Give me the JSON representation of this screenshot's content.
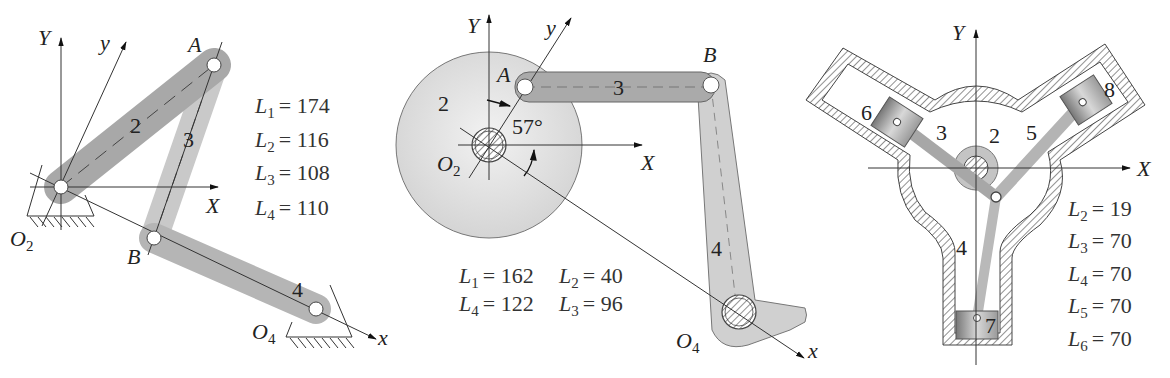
{
  "figures": [
    {
      "id": "four-bar-linkage",
      "axes": {
        "X": "X",
        "Y": "Y",
        "x": "x",
        "y": "y"
      },
      "points": {
        "O2": "O",
        "O2_sub": "2",
        "O4": "O",
        "O4_sub": "4",
        "A": "A",
        "B": "B"
      },
      "links": [
        "2",
        "3",
        "4"
      ],
      "lengths": [
        {
          "sym": "L",
          "sub": "1",
          "value": "= 174"
        },
        {
          "sym": "L",
          "sub": "2",
          "value": "= 116"
        },
        {
          "sym": "L",
          "sub": "3",
          "value": "= 108"
        },
        {
          "sym": "L",
          "sub": "4",
          "value": "= 110"
        }
      ]
    },
    {
      "id": "disc-crank-linkage",
      "axes": {
        "X": "X",
        "Y": "Y",
        "x": "x",
        "y": "y"
      },
      "points": {
        "O2": "O",
        "O2_sub": "2",
        "O4": "O",
        "O4_sub": "4",
        "A": "A",
        "B": "B"
      },
      "links": [
        "2",
        "3",
        "4"
      ],
      "angle": "57°",
      "lengths": [
        {
          "sym": "L",
          "sub": "1",
          "value": "= 162"
        },
        {
          "sym": "L",
          "sub": "2",
          "value": "= 40"
        },
        {
          "sym": "L",
          "sub": "4",
          "value": "= 122"
        },
        {
          "sym": "L",
          "sub": "3",
          "value": "= 96"
        }
      ]
    },
    {
      "id": "radial-engine",
      "axes": {
        "X": "X",
        "Y": "Y"
      },
      "links": [
        "2",
        "3",
        "4",
        "5",
        "6",
        "7",
        "8"
      ],
      "lengths": [
        {
          "sym": "L",
          "sub": "2",
          "value": "= 19"
        },
        {
          "sym": "L",
          "sub": "3",
          "value": "= 70"
        },
        {
          "sym": "L",
          "sub": "4",
          "value": "= 70"
        },
        {
          "sym": "L",
          "sub": "5",
          "value": "= 70"
        },
        {
          "sym": "L",
          "sub": "6",
          "value": "= 70"
        }
      ]
    }
  ],
  "colors": {
    "link_dark": "#a9a9a9",
    "link_light": "#c8c8c8",
    "disc": "#dedede",
    "line": "#333333"
  }
}
